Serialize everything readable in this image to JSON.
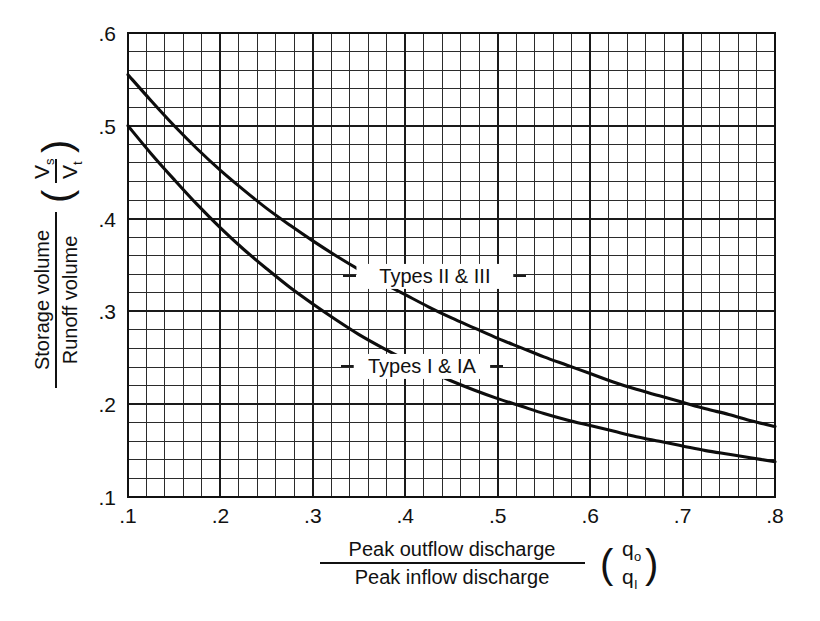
{
  "chart_data": {
    "type": "line",
    "title": "",
    "subtitle": "",
    "xlabel_numerator": "Peak outflow discharge",
    "xlabel_denominator": "Peak inflow discharge",
    "xlabel_symbol_numerator": "q",
    "xlabel_symbol_numerator_sub": "o",
    "xlabel_symbol_denominator": "q",
    "xlabel_symbol_denominator_sub": "I",
    "ylabel_numerator": "Storage volume",
    "ylabel_denominator": "Runoff volume",
    "ylabel_symbol_numerator": "V",
    "ylabel_symbol_numerator_sub": "s",
    "ylabel_symbol_denominator": "V",
    "ylabel_symbol_denominator_sub": "t",
    "xlim": [
      0.1,
      0.8
    ],
    "ylim": [
      0.1,
      0.6
    ],
    "xticks": [
      0.1,
      0.2,
      0.3,
      0.4,
      0.5,
      0.6,
      0.7,
      0.8
    ],
    "xtick_labels": [
      ".1",
      ".2",
      ".3",
      ".4",
      ".5",
      ".6",
      ".7",
      ".8"
    ],
    "yticks": [
      0.1,
      0.2,
      0.3,
      0.4,
      0.5,
      0.6
    ],
    "ytick_labels": [
      ".1",
      ".2",
      ".3",
      ".4",
      ".5",
      ".6"
    ],
    "grid": true,
    "grid_minor_divisions": 5,
    "legend_position": "inline-callout",
    "line_color": "#0d0d0d",
    "grid_color": "#2b2b2b",
    "series": [
      {
        "name": "Types II & III",
        "label": "Types II & III",
        "label_x": 0.432,
        "label_y": 0.335,
        "x": [
          0.1,
          0.125,
          0.15,
          0.175,
          0.2,
          0.225,
          0.25,
          0.275,
          0.3,
          0.325,
          0.35,
          0.375,
          0.4,
          0.425,
          0.45,
          0.475,
          0.5,
          0.525,
          0.55,
          0.575,
          0.6,
          0.625,
          0.65,
          0.675,
          0.7,
          0.725,
          0.75,
          0.775,
          0.8
        ],
        "values": [
          0.555,
          0.527,
          0.5,
          0.475,
          0.452,
          0.431,
          0.411,
          0.393,
          0.376,
          0.36,
          0.345,
          0.331,
          0.318,
          0.305,
          0.293,
          0.282,
          0.271,
          0.261,
          0.251,
          0.242,
          0.233,
          0.224,
          0.216,
          0.209,
          0.202,
          0.195,
          0.189,
          0.182,
          0.176
        ]
      },
      {
        "name": "Types I & IA",
        "label": "Types I & IA",
        "label_x": 0.418,
        "label_y": 0.238,
        "x": [
          0.1,
          0.125,
          0.15,
          0.175,
          0.2,
          0.225,
          0.25,
          0.275,
          0.3,
          0.325,
          0.35,
          0.375,
          0.4,
          0.425,
          0.45,
          0.475,
          0.5,
          0.525,
          0.55,
          0.575,
          0.6,
          0.625,
          0.65,
          0.675,
          0.7,
          0.725,
          0.75,
          0.775,
          0.8
        ],
        "values": [
          0.5,
          0.47,
          0.442,
          0.415,
          0.39,
          0.367,
          0.346,
          0.326,
          0.308,
          0.291,
          0.275,
          0.261,
          0.248,
          0.236,
          0.225,
          0.215,
          0.206,
          0.198,
          0.19,
          0.183,
          0.177,
          0.171,
          0.165,
          0.16,
          0.155,
          0.15,
          0.146,
          0.142,
          0.138
        ]
      }
    ]
  },
  "plot_geometry": {
    "left": 128,
    "top": 33,
    "right": 775,
    "bottom": 497
  }
}
